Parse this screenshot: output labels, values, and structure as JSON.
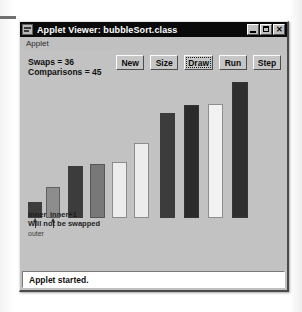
{
  "window": {
    "title": "Applet Viewer: bubbleSort.class",
    "icon": "applet-viewer-icon",
    "controls": {
      "minimize": "minimize-icon",
      "maximize": "maximize-icon",
      "close": "✕"
    }
  },
  "menubar": {
    "items": [
      {
        "label": "Applet"
      }
    ]
  },
  "stats": {
    "swaps_label": "Swaps = 36",
    "comparisons_label": "Comparisons = 45",
    "swaps": 36,
    "comparisons": 45
  },
  "toolbar": {
    "buttons": [
      {
        "label": "New",
        "focused": false
      },
      {
        "label": "Size",
        "focused": false
      },
      {
        "label": "Draw",
        "focused": true
      },
      {
        "label": "Run",
        "focused": false
      },
      {
        "label": "Step",
        "focused": false
      }
    ]
  },
  "annotations": {
    "inner": "inner",
    "inner_plus_one": "inner+1",
    "message": "Will not be swapped",
    "outer": "outer"
  },
  "statusbar": {
    "text": "Applet started."
  },
  "colors": {
    "window_face": "#c0c0c0",
    "applet_face": "#c2c2c2",
    "titlebar": "#0a0a0a",
    "titlebar_text": "#ffffff",
    "status_bg": "#ffffff",
    "bar_dark": "#3c3c3c",
    "bar_mid": "#8d8d8d",
    "bar_light": "#ececec"
  },
  "chart_data": {
    "type": "bar",
    "xlabel": "",
    "ylabel": "",
    "grid": false,
    "legend": null,
    "categories": [
      "0",
      "1",
      "2",
      "3",
      "4",
      "5",
      "6",
      "7",
      "8",
      "9"
    ],
    "values": [
      17,
      33,
      55,
      58,
      60,
      80,
      112,
      120,
      122,
      145
    ],
    "ylim": [
      0,
      160
    ],
    "bar_colors": [
      "#3c3c3c",
      "#8d8d8d",
      "#3c3c3c",
      "#787878",
      "#ececec",
      "#ececec",
      "#3c3c3c",
      "#2b2b2b",
      "#f2f2f2",
      "#2f2f2f"
    ],
    "bar_x": [
      8,
      26,
      48,
      70,
      92,
      114,
      140,
      164,
      188,
      212
    ],
    "bar_width": [
      14,
      14,
      15,
      15,
      15,
      15,
      15,
      15,
      15,
      16
    ],
    "pointers": [
      {
        "label": "inner",
        "bar_index": 0
      },
      {
        "label": "inner+1",
        "bar_index": 1
      }
    ]
  }
}
